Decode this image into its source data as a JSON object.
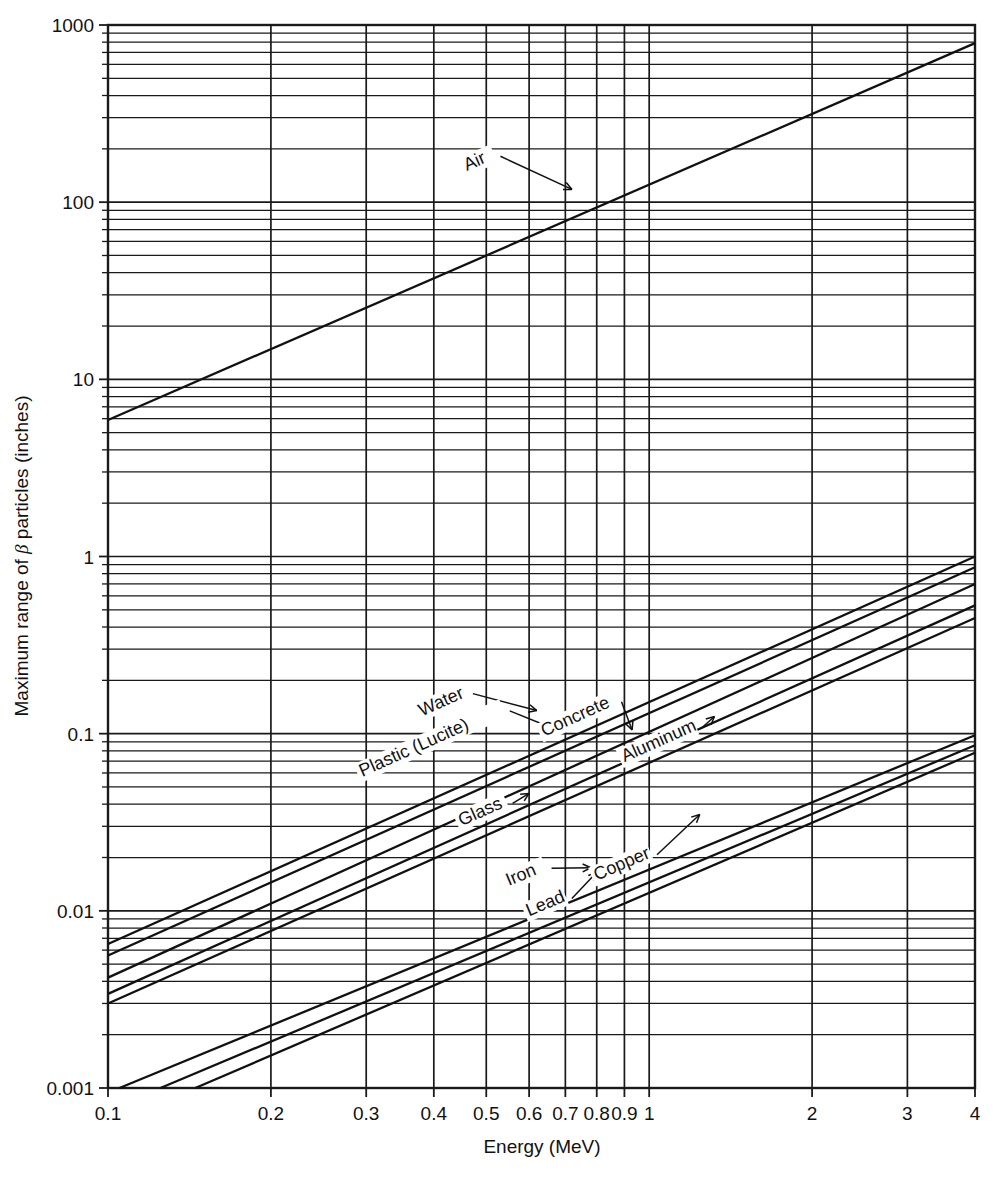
{
  "figure": {
    "x_axis_title": "Energy (MeV)",
    "y_axis_title_pre": "Maximum range of ",
    "y_axis_title_beta": "β",
    "y_axis_title_post": " particles (inches)",
    "caption_partial": "Figure — Maximum range of beta particles in various materials."
  },
  "chart_data": {
    "type": "line",
    "title": "",
    "xlabel": "Energy (MeV)",
    "ylabel": "Maximum range of β particles (inches)",
    "xscale": "log",
    "yscale": "log",
    "xlim": [
      0.1,
      4
    ],
    "ylim": [
      0.001,
      1000
    ],
    "grid": true,
    "grid_minor": true,
    "legend": "inline-labels-with-leader-lines",
    "x_ticks": [
      0.1,
      0.2,
      0.3,
      0.4,
      0.5,
      0.6,
      0.7,
      0.8,
      0.9,
      1,
      2,
      3,
      4
    ],
    "x_tick_labels": [
      "0.1",
      "0.2",
      "0.3",
      "0.4",
      "0.5",
      "0.6",
      "0.7",
      "0.8",
      "0.9",
      "1",
      "2",
      "3",
      "4"
    ],
    "y_ticks": [
      0.001,
      0.01,
      0.1,
      1,
      10,
      100,
      1000
    ],
    "y_tick_labels": [
      "0.001",
      "0.01",
      "0.1",
      "1",
      "10",
      "100",
      "1000"
    ],
    "series": [
      {
        "name": "Air",
        "label": "Air",
        "x": [
          0.1,
          4
        ],
        "y": [
          5.9,
          790
        ],
        "label_x": 0.46,
        "label_y": 150,
        "leader_to_x": 0.72,
        "leader_to_y": 118
      },
      {
        "name": "Water",
        "label": "Water",
        "x": [
          0.1,
          4
        ],
        "y": [
          0.0065,
          1.0
        ],
        "label_x": 0.38,
        "label_y": 0.125,
        "leader_to_x": 0.62,
        "leader_to_y": 0.135
      },
      {
        "name": "Plastic (Lucite)",
        "label": "Plastic (Lucite)",
        "x": [
          0.1,
          4
        ],
        "y": [
          0.0056,
          0.87
        ],
        "label_x": 0.295,
        "label_y": 0.057,
        "leader_to_x": 0.66,
        "leader_to_y": 0.108
      },
      {
        "name": "Concrete",
        "label": "Concrete",
        "x": [
          0.1,
          4
        ],
        "y": [
          0.0042,
          0.7
        ],
        "label_x": 0.64,
        "label_y": 0.096,
        "leader_to_x": 0.93,
        "leader_to_y": 0.105
      },
      {
        "name": "Glass",
        "label": "Glass",
        "x": [
          0.1,
          4
        ],
        "y": [
          0.0034,
          0.53
        ],
        "label_x": 0.45,
        "label_y": 0.03,
        "leader_to_x": 0.6,
        "leader_to_y": 0.046
      },
      {
        "name": "Aluminum",
        "label": "Aluminum",
        "x": [
          0.1,
          4
        ],
        "y": [
          0.003,
          0.45
        ],
        "label_x": 0.9,
        "label_y": 0.069,
        "leader_to_x": 1.32,
        "leader_to_y": 0.125
      },
      {
        "name": "Iron",
        "label": "Iron",
        "x": [
          0.105,
          4
        ],
        "y": [
          0.001,
          0.098
        ],
        "label_x": 0.55,
        "label_y": 0.0138,
        "leader_to_x": 0.78,
        "leader_to_y": 0.0175
      },
      {
        "name": "Lead",
        "label": "Lead",
        "x": [
          0.125,
          4
        ],
        "y": [
          0.001,
          0.086
        ],
        "label_x": 0.6,
        "label_y": 0.0093,
        "leader_to_x": 0.8,
        "leader_to_y": 0.0165
      },
      {
        "name": "Copper",
        "label": "Copper",
        "x": [
          0.145,
          4
        ],
        "y": [
          0.001,
          0.078
        ],
        "label_x": 0.8,
        "label_y": 0.0148,
        "leader_to_x": 1.24,
        "leader_to_y": 0.035
      }
    ]
  }
}
